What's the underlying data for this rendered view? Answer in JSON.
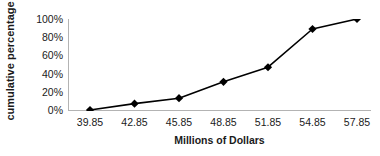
{
  "chart_data": {
    "type": "line",
    "title": "",
    "subtitle": "",
    "xlabel": "Millions of Dollars",
    "ylabel": "cumulative percentage",
    "categories": [
      "39.85",
      "42.85",
      "45.85",
      "48.85",
      "51.85",
      "54.85",
      "57.85"
    ],
    "x": [
      39.85,
      42.85,
      45.85,
      48.85,
      51.85,
      54.85,
      57.85
    ],
    "values": [
      0,
      7,
      13,
      31,
      47,
      89,
      100
    ],
    "point_labels": [
      "0%",
      "7%",
      "13%",
      "31%",
      "47%",
      "89%",
      "100%"
    ],
    "ylim": [
      0,
      100
    ],
    "ytick_labels": [
      "0%",
      "20%",
      "40%",
      "60%",
      "80%",
      "100%"
    ],
    "ytick_values": [
      0,
      20,
      40,
      60,
      80,
      100
    ],
    "grid": false,
    "legend": false,
    "legend_position": "none",
    "marker": "diamond",
    "series": [
      {
        "name": "cumulative percentage",
        "values": [
          0,
          7,
          13,
          31,
          47,
          89,
          100
        ]
      }
    ]
  },
  "colors": {
    "line": "#000000",
    "marker": "#000000",
    "axis": "#b3b3b3",
    "text": "#1a1a1a",
    "background": "#ffffff"
  }
}
